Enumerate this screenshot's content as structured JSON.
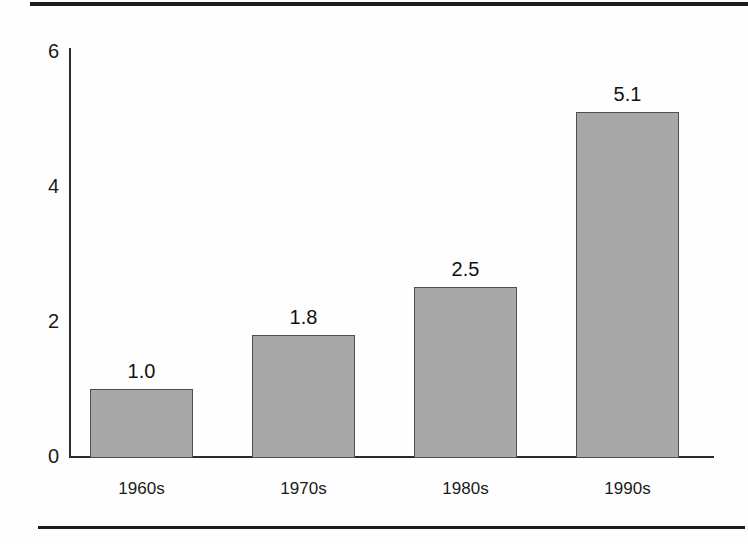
{
  "chart_data": {
    "type": "bar",
    "title": "",
    "subtitle": "",
    "xlabel": "",
    "ylabel": "",
    "categories": [
      "1960s",
      "1970s",
      "1980s",
      "1990s"
    ],
    "values": [
      1.0,
      1.8,
      2.5,
      5.1
    ],
    "value_labels": [
      "1.0",
      "1.8",
      "2.5",
      "5.1"
    ],
    "ylim": [
      0,
      6
    ],
    "yticks": [
      0,
      2,
      4,
      6
    ],
    "ytick_labels": [
      "0",
      "2",
      "4",
      "6"
    ],
    "grid": false,
    "legend": false,
    "legend_position": "none",
    "bar_fill_color": "#a8a8a8",
    "bar_stroke_color": "#4f4f4f",
    "axis_color": "#2b2b2b",
    "text_color": "#1a1a1a"
  },
  "decorations": {
    "rule_top": "horizontal-rule",
    "rule_bottom": "horizontal-rule"
  }
}
